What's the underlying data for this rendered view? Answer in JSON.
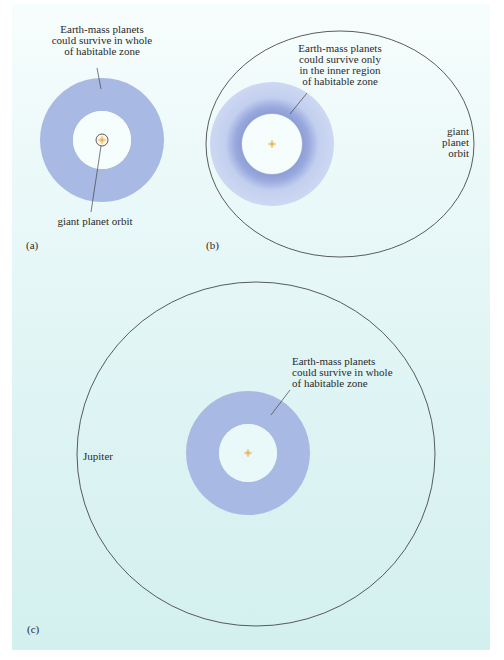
{
  "figure": {
    "background_color": "#dff4f4",
    "ring_color": "#a8b9e4",
    "ring_light_color": "#cfdaf2",
    "ring_band_color": "#8e9fd6",
    "orbit_stroke_color": "#333333",
    "star_color": "#e8a33a"
  },
  "panels": [
    {
      "tag": "(a)",
      "annotation": {
        "lines": [
          "Earth-mass planets",
          "could survive in whole",
          "of habitable zone"
        ]
      },
      "orbit_label": "giant planet orbit"
    },
    {
      "tag": "(b)",
      "annotation": {
        "lines": [
          "Earth-mass planets",
          "could survive only",
          "in the inner region",
          "of habitable zone"
        ]
      },
      "orbit_label": {
        "lines": [
          "giant",
          "planet",
          "orbit"
        ]
      }
    },
    {
      "tag": "(c)",
      "annotation": {
        "lines": [
          "Earth-mass planets",
          "could survive in whole",
          "of habitable zone"
        ]
      },
      "orbit_label": "Jupiter"
    }
  ]
}
